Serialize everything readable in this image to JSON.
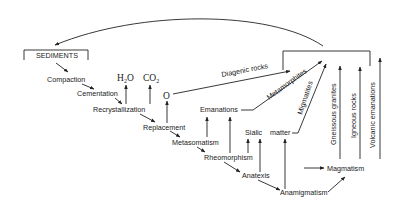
{
  "diagram": {
    "title_box": "SEDIMENTS",
    "diagenesis_chain": [
      "Compaction",
      "Cementation",
      "Recrystallization",
      "Replacement",
      "Metasomatism",
      "Rheomorphism",
      "Anatexis",
      "Anamigmatism"
    ],
    "magmatism": "Magmatism",
    "volatiles": {
      "h2o": {
        "base": "H",
        "sub": "2",
        "tail": "O"
      },
      "co2": {
        "base": "CO",
        "sub": "2"
      },
      "o": "O"
    },
    "emanations": "Emanations",
    "sialic": "Sialic",
    "matter": "matter",
    "products": {
      "diagenic_rocks": "Diagenic rocks",
      "metamorphites": "Metamorphites",
      "migmatites": "Migmatites",
      "gneissous_granites": "Gneissous granites",
      "igneous_rocks": "Igneous rocks",
      "volcanic_emanations": "Volcanic emanations"
    }
  }
}
